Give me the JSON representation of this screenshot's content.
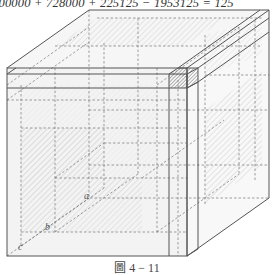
{
  "equation": {
    "text": "000000 + 728000 + 225125 − 1953125 = 125"
  },
  "caption": {
    "text": "圖 4 − 11"
  },
  "labels": {
    "a": "a",
    "b": "b",
    "c": "c"
  },
  "colors": {
    "stroke": "#555555",
    "dash": "#777777",
    "face_fill": "#f4f4f4",
    "hatch": "#bdbdbd",
    "small_cube_hatch": "#555555"
  },
  "geometry": {
    "front_face": {
      "x1": 7,
      "y1": 68,
      "x2": 187,
      "y2": 256
    },
    "depth_offset": {
      "dx": 82,
      "dy": -58
    },
    "slab_top_y": 85,
    "slab_left_x": 169,
    "small_cube": {
      "x1": 169,
      "y1": 68,
      "x2": 187,
      "y2": 85
    }
  }
}
